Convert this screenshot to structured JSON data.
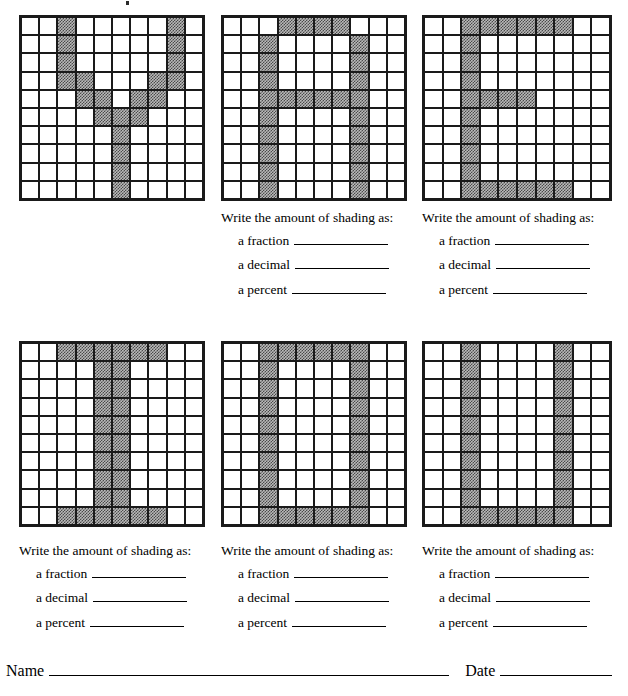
{
  "worksheet": {
    "rows": 10,
    "cols": 10,
    "total_cells": 100,
    "shade_color": "#808080",
    "line_color": "#1a1a1a"
  },
  "prompt": {
    "heading": "Write the amount of shading as:",
    "fraction_label": "a fraction",
    "decimal_label": "a decimal",
    "percent_label": "a percent",
    "blank": ""
  },
  "footer": {
    "name_label": "Name",
    "date_label": "Date",
    "name_value": "",
    "date_value": ""
  },
  "grids": [
    {
      "id": "grid-1",
      "letter": "Y",
      "shaded_count": 16,
      "shaded_cells": [
        [
          0,
          2
        ],
        [
          0,
          8
        ],
        [
          1,
          2
        ],
        [
          1,
          8
        ],
        [
          2,
          2
        ],
        [
          2,
          8
        ],
        [
          3,
          2
        ],
        [
          3,
          3
        ],
        [
          3,
          7
        ],
        [
          3,
          8
        ],
        [
          4,
          3
        ],
        [
          4,
          4
        ],
        [
          4,
          6
        ],
        [
          4,
          7
        ],
        [
          5,
          4
        ],
        [
          5,
          5
        ],
        [
          5,
          6
        ],
        [
          6,
          5
        ],
        [
          7,
          5
        ],
        [
          8,
          5
        ],
        [
          9,
          5
        ]
      ],
      "has_question": false
    },
    {
      "id": "grid-2",
      "letter": "A",
      "shaded_count": 26,
      "shaded_cells": [
        [
          0,
          3
        ],
        [
          0,
          4
        ],
        [
          0,
          5
        ],
        [
          0,
          6
        ],
        [
          1,
          2
        ],
        [
          1,
          7
        ],
        [
          2,
          2
        ],
        [
          2,
          7
        ],
        [
          3,
          2
        ],
        [
          3,
          7
        ],
        [
          4,
          2
        ],
        [
          4,
          3
        ],
        [
          4,
          4
        ],
        [
          4,
          5
        ],
        [
          4,
          6
        ],
        [
          4,
          7
        ],
        [
          5,
          2
        ],
        [
          5,
          7
        ],
        [
          6,
          2
        ],
        [
          6,
          7
        ],
        [
          7,
          2
        ],
        [
          7,
          7
        ],
        [
          8,
          2
        ],
        [
          8,
          7
        ],
        [
          9,
          2
        ],
        [
          9,
          7
        ]
      ],
      "has_question": true
    },
    {
      "id": "grid-3",
      "letter": "E",
      "shaded_count": 24,
      "shaded_cells": [
        [
          0,
          2
        ],
        [
          0,
          3
        ],
        [
          0,
          4
        ],
        [
          0,
          5
        ],
        [
          0,
          6
        ],
        [
          0,
          7
        ],
        [
          1,
          2
        ],
        [
          2,
          2
        ],
        [
          3,
          2
        ],
        [
          4,
          2
        ],
        [
          4,
          3
        ],
        [
          4,
          4
        ],
        [
          4,
          5
        ],
        [
          5,
          2
        ],
        [
          6,
          2
        ],
        [
          7,
          2
        ],
        [
          8,
          2
        ],
        [
          9,
          2
        ],
        [
          9,
          3
        ],
        [
          9,
          4
        ],
        [
          9,
          5
        ],
        [
          9,
          6
        ],
        [
          9,
          7
        ]
      ],
      "has_question": true
    },
    {
      "id": "grid-4",
      "letter": "I",
      "shaded_count": 28,
      "shaded_cells": [
        [
          0,
          2
        ],
        [
          0,
          3
        ],
        [
          0,
          4
        ],
        [
          0,
          5
        ],
        [
          0,
          6
        ],
        [
          0,
          7
        ],
        [
          1,
          4
        ],
        [
          1,
          5
        ],
        [
          2,
          4
        ],
        [
          2,
          5
        ],
        [
          3,
          4
        ],
        [
          3,
          5
        ],
        [
          4,
          4
        ],
        [
          4,
          5
        ],
        [
          5,
          4
        ],
        [
          5,
          5
        ],
        [
          6,
          4
        ],
        [
          6,
          5
        ],
        [
          7,
          4
        ],
        [
          7,
          5
        ],
        [
          8,
          4
        ],
        [
          8,
          5
        ],
        [
          9,
          2
        ],
        [
          9,
          3
        ],
        [
          9,
          4
        ],
        [
          9,
          5
        ],
        [
          9,
          6
        ],
        [
          9,
          7
        ]
      ],
      "has_question": true
    },
    {
      "id": "grid-5",
      "letter": "O",
      "shaded_count": 28,
      "shaded_cells": [
        [
          0,
          2
        ],
        [
          0,
          3
        ],
        [
          0,
          4
        ],
        [
          0,
          5
        ],
        [
          0,
          6
        ],
        [
          0,
          7
        ],
        [
          1,
          2
        ],
        [
          1,
          7
        ],
        [
          2,
          2
        ],
        [
          2,
          7
        ],
        [
          3,
          2
        ],
        [
          3,
          7
        ],
        [
          4,
          2
        ],
        [
          4,
          7
        ],
        [
          5,
          2
        ],
        [
          5,
          7
        ],
        [
          6,
          2
        ],
        [
          6,
          7
        ],
        [
          7,
          2
        ],
        [
          7,
          7
        ],
        [
          8,
          2
        ],
        [
          8,
          7
        ],
        [
          9,
          2
        ],
        [
          9,
          3
        ],
        [
          9,
          4
        ],
        [
          9,
          5
        ],
        [
          9,
          6
        ],
        [
          9,
          7
        ]
      ],
      "has_question": true
    },
    {
      "id": "grid-6",
      "letter": "U",
      "shaded_count": 24,
      "shaded_cells": [
        [
          0,
          2
        ],
        [
          0,
          7
        ],
        [
          1,
          2
        ],
        [
          1,
          7
        ],
        [
          2,
          2
        ],
        [
          2,
          7
        ],
        [
          3,
          2
        ],
        [
          3,
          7
        ],
        [
          4,
          2
        ],
        [
          4,
          7
        ],
        [
          5,
          2
        ],
        [
          5,
          7
        ],
        [
          6,
          2
        ],
        [
          6,
          7
        ],
        [
          7,
          2
        ],
        [
          7,
          7
        ],
        [
          8,
          2
        ],
        [
          8,
          7
        ],
        [
          9,
          2
        ],
        [
          9,
          3
        ],
        [
          9,
          4
        ],
        [
          9,
          5
        ],
        [
          9,
          6
        ],
        [
          9,
          7
        ]
      ],
      "has_question": true
    }
  ],
  "layout": {
    "grid_boxes": [
      {
        "left": 19,
        "top": 15,
        "width": 186,
        "height": 186
      },
      {
        "left": 221,
        "top": 15,
        "width": 186,
        "height": 186
      },
      {
        "left": 422,
        "top": 15,
        "width": 190,
        "height": 186
      },
      {
        "left": 19,
        "top": 341,
        "width": 186,
        "height": 186
      },
      {
        "left": 221,
        "top": 341,
        "width": 186,
        "height": 186
      },
      {
        "left": 422,
        "top": 341,
        "width": 190,
        "height": 186
      }
    ],
    "question_boxes": [
      null,
      {
        "left": 221,
        "top": 211
      },
      {
        "left": 422,
        "top": 211
      },
      {
        "left": 19,
        "top": 544
      },
      {
        "left": 221,
        "top": 544
      },
      {
        "left": 422,
        "top": 544
      }
    ]
  }
}
